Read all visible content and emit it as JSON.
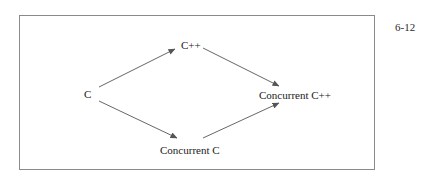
{
  "page": {
    "number": "6-12"
  },
  "diagram": {
    "nodes": [
      {
        "id": "c",
        "label": "C"
      },
      {
        "id": "cpp",
        "label": "C++"
      },
      {
        "id": "concurrent_c",
        "label": "Concurrent C"
      },
      {
        "id": "concurrent_cpp",
        "label": "Concurrent C++"
      }
    ],
    "edges": [
      {
        "from": "c",
        "to": "cpp"
      },
      {
        "from": "cpp",
        "to": "concurrent_cpp"
      },
      {
        "from": "c",
        "to": "concurrent_c"
      },
      {
        "from": "concurrent_c",
        "to": "concurrent_cpp"
      }
    ],
    "colors": {
      "line": "#555555",
      "frame": "#8a8a8a",
      "text": "#1a1a1a"
    }
  }
}
